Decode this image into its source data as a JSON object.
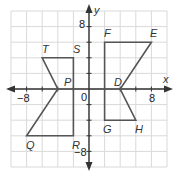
{
  "diagram": {
    "type": "coordinate-plane",
    "axes": {
      "x_label": "x",
      "y_label": "y",
      "origin_label": "0",
      "x_ticks": [
        {
          "value": -8,
          "label": "−8"
        },
        {
          "value": 8,
          "label": "8"
        }
      ],
      "y_ticks": [
        {
          "value": 8,
          "label": "8"
        },
        {
          "value": -8,
          "label": "−8"
        }
      ],
      "range": {
        "xmin": -10,
        "xmax": 10,
        "ymin": -10,
        "ymax": 10
      },
      "grid_step": 2
    },
    "figures": [
      {
        "name": "pentagon-TSRQP",
        "vertices": [
          {
            "label": "T",
            "x": -6,
            "y": 4
          },
          {
            "label": "S",
            "x": -2,
            "y": 4
          },
          {
            "label": "R",
            "x": -2,
            "y": -6
          },
          {
            "label": "Q",
            "x": -8,
            "y": -6
          },
          {
            "label": "P",
            "x": -4,
            "y": 0
          }
        ]
      },
      {
        "name": "pentagon-FEDHG",
        "vertices": [
          {
            "label": "F",
            "x": 2,
            "y": 6
          },
          {
            "label": "E",
            "x": 8,
            "y": 6
          },
          {
            "label": "D",
            "x": 4,
            "y": 0
          },
          {
            "label": "H",
            "x": 6,
            "y": -4
          },
          {
            "label": "G",
            "x": 2,
            "y": -4
          }
        ]
      }
    ],
    "colors": {
      "grid": "#d9d9d9",
      "axis": "#333333",
      "figure_stroke": "#555555",
      "label": "#333333"
    }
  },
  "labels": {
    "T": "T",
    "S": "S",
    "P": "P",
    "R": "R",
    "Q": "Q",
    "F": "F",
    "E": "E",
    "D": "D",
    "G": "G",
    "H": "H",
    "x_axis": "x",
    "y_axis": "y",
    "origin": "0",
    "x_neg8": "−8",
    "x_pos8": "8",
    "y_pos8": "8",
    "y_neg8": "−8"
  }
}
